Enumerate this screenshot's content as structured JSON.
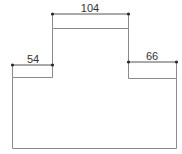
{
  "diagram": {
    "type": "dimensioned-outline",
    "shape": "stepped-profile",
    "colors": {
      "background": "#ffffff",
      "outline": "#8a8a8a",
      "dimension_line": "#555555",
      "endpoint": "#2a2a2a",
      "text": "#333333"
    },
    "dimensions": {
      "top": {
        "label": "104"
      },
      "left_step": {
        "label": "54"
      },
      "right_step": {
        "label": "66"
      }
    }
  }
}
